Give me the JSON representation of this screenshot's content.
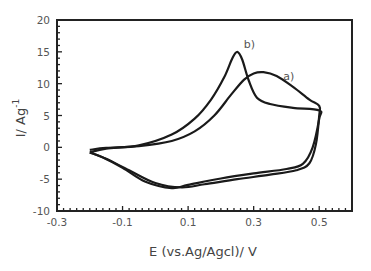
{
  "chart_data": {
    "type": "line",
    "title": "",
    "xlabel": "E (vs.Ag/Agcl)/ V",
    "ylabel": "I/ Ag-1",
    "ylabel_main": "I/ Ag",
    "ylabel_sup": "-1",
    "xlim": [
      -0.3,
      0.6
    ],
    "ylim": [
      -10,
      20
    ],
    "x_ticks": [
      "-0.3",
      "-0.1",
      "0.1",
      "0.3",
      "0.5"
    ],
    "x_tick_values": [
      -0.3,
      -0.1,
      0.1,
      0.3,
      0.5
    ],
    "y_ticks": [
      "20",
      "15",
      "10",
      "5",
      "0",
      "-5",
      "-10"
    ],
    "y_tick_values": [
      20,
      15,
      10,
      5,
      0,
      -5,
      -10
    ],
    "grid": false,
    "legend": "none (inline annotations)",
    "annotations": [
      {
        "text": "a)",
        "x": 0.39,
        "y": 10.5
      },
      {
        "text": "b)",
        "x": 0.27,
        "y": 15.6
      }
    ],
    "series": [
      {
        "name": "a)",
        "points": [
          [
            -0.2,
            -0.4
          ],
          [
            -0.15,
            -0.1
          ],
          [
            -0.05,
            0.2
          ],
          [
            0.05,
            1.0
          ],
          [
            0.12,
            2.5
          ],
          [
            0.18,
            5.0
          ],
          [
            0.23,
            8.2
          ],
          [
            0.27,
            10.6
          ],
          [
            0.3,
            11.6
          ],
          [
            0.33,
            11.8
          ],
          [
            0.37,
            11.2
          ],
          [
            0.42,
            9.5
          ],
          [
            0.47,
            7.5
          ],
          [
            0.5,
            6.5
          ],
          [
            0.5,
            5.0
          ],
          [
            0.49,
            0.5
          ],
          [
            0.47,
            -2.5
          ],
          [
            0.43,
            -3.6
          ],
          [
            0.35,
            -4.3
          ],
          [
            0.25,
            -5.0
          ],
          [
            0.15,
            -5.8
          ],
          [
            0.08,
            -6.3
          ],
          [
            0.0,
            -5.6
          ],
          [
            -0.08,
            -3.6
          ],
          [
            -0.15,
            -1.8
          ],
          [
            -0.2,
            -0.8
          ]
        ]
      },
      {
        "name": "b)",
        "points": [
          [
            -0.2,
            -0.8
          ],
          [
            -0.15,
            -0.2
          ],
          [
            -0.05,
            0.3
          ],
          [
            0.05,
            2.0
          ],
          [
            0.12,
            4.5
          ],
          [
            0.17,
            7.5
          ],
          [
            0.21,
            11.0
          ],
          [
            0.235,
            14.0
          ],
          [
            0.25,
            15.0
          ],
          [
            0.265,
            13.8
          ],
          [
            0.285,
            10.5
          ],
          [
            0.31,
            7.8
          ],
          [
            0.35,
            6.8
          ],
          [
            0.42,
            6.2
          ],
          [
            0.5,
            5.8
          ],
          [
            0.5,
            4.5
          ],
          [
            0.48,
            0.0
          ],
          [
            0.45,
            -2.6
          ],
          [
            0.4,
            -3.4
          ],
          [
            0.3,
            -4.1
          ],
          [
            0.2,
            -4.9
          ],
          [
            0.1,
            -5.9
          ],
          [
            0.05,
            -6.4
          ],
          [
            -0.03,
            -5.4
          ],
          [
            -0.1,
            -3.2
          ],
          [
            -0.16,
            -1.6
          ],
          [
            -0.2,
            -0.8
          ]
        ]
      }
    ]
  }
}
